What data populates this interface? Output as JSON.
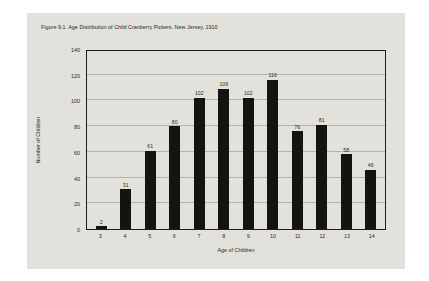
{
  "figure": {
    "title": "Figure 9.1. Age Distribution of Child Cranberry Pickers, New Jersey, 1910",
    "background_color": "#e2e1dc",
    "page_color": "#ffffff",
    "bar_color": "#131311",
    "gridline_color": "#b3b2ac",
    "axis_color": "#1c1c1a"
  },
  "chart_data": {
    "type": "bar",
    "title": "Figure 9.1. Age Distribution of Child Cranberry Pickers, New Jersey, 1910",
    "xlabel": "Age of Children",
    "ylabel": "Number of Children",
    "categories": [
      "3",
      "4",
      "5",
      "6",
      "7",
      "8",
      "9",
      "10",
      "11",
      "12",
      "13",
      "14"
    ],
    "values": [
      2,
      31,
      61,
      80,
      102,
      109,
      102,
      116,
      76,
      81,
      58,
      46
    ],
    "data_labels": [
      "2",
      "31",
      "61",
      "80",
      "102",
      "109",
      "102",
      "116",
      "76",
      "81",
      "58",
      "46"
    ],
    "ylim": [
      0,
      140
    ],
    "ytick_values": [
      0,
      20,
      40,
      60,
      80,
      100,
      120,
      140
    ],
    "ytick_labels": [
      "0",
      "20",
      "40",
      "60",
      "80",
      "100",
      "120",
      "140"
    ],
    "grid": true,
    "grid_axis": "y",
    "legend": false,
    "legend_position": "none"
  }
}
